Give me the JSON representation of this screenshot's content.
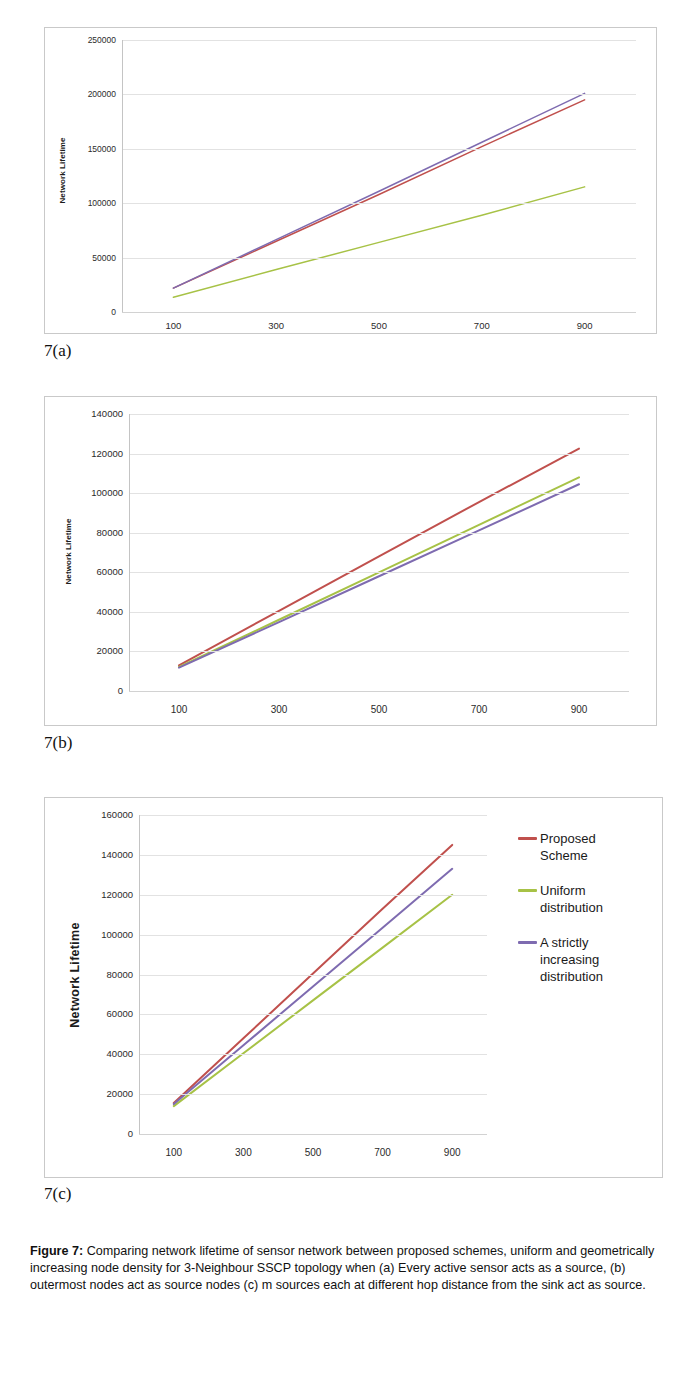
{
  "figure": {
    "caption_label": "Figure 7:",
    "caption_text": " Comparing network lifetime of sensor network between proposed schemes, uniform and geometrically increasing node density for 3-Neighbour SSCP topology when (a) Every active sensor acts as a source, (b) outermost nodes act as source nodes (c) m sources each at different hop distance from the sink act as source.",
    "sublabel_a": "7(a)",
    "sublabel_b": "7(b)",
    "sublabel_c": "7(c)"
  },
  "colors": {
    "proposed": "#C0504D",
    "uniform": "#A7C246",
    "strictly_increasing": "#7E6BB0",
    "grid": "#e2e2e2",
    "frame": "#c9c9c9"
  },
  "legend": {
    "items": [
      {
        "label": "Proposed\nScheme",
        "color": "#C0504D",
        "series": "Proposed Scheme"
      },
      {
        "label": "Uniform\ndistribution",
        "color": "#A7C246",
        "series": "Uniform distribution"
      },
      {
        "label": "A strictly\nincreasing\ndistribution",
        "color": "#7E6BB0",
        "series": "A strictly increasing distribution"
      }
    ]
  },
  "chart_data": [
    {
      "id": "chart_a",
      "type": "line",
      "title": "",
      "xlabel": "",
      "ylabel": "Network Lifetime",
      "x": [
        100,
        300,
        500,
        700,
        900
      ],
      "xticks": [
        "100",
        "300",
        "500",
        "700",
        "900"
      ],
      "yticks": [
        "0",
        "50000",
        "100000",
        "150000",
        "200000",
        "250000"
      ],
      "ytickvalues": [
        0,
        50000,
        100000,
        150000,
        200000,
        250000
      ],
      "ylim": [
        0,
        250000
      ],
      "xlim": [
        0,
        1000
      ],
      "grid": true,
      "legend_position": "none",
      "series": [
        {
          "name": "Proposed Scheme",
          "color": "#C0504D",
          "values": [
            22000,
            65000,
            108000,
            152000,
            195000
          ]
        },
        {
          "name": "Uniform distribution",
          "color": "#A7C246",
          "values": [
            13500,
            39000,
            64000,
            89000,
            115000
          ]
        },
        {
          "name": "A strictly increasing distribution",
          "color": "#7E6BB0",
          "values": [
            22000,
            66500,
            111000,
            156000,
            201000
          ]
        }
      ]
    },
    {
      "id": "chart_b",
      "type": "line",
      "title": "",
      "xlabel": "",
      "ylabel": "Network Lifetime",
      "x": [
        100,
        300,
        500,
        700,
        900
      ],
      "xticks": [
        "100",
        "300",
        "500",
        "700",
        "900"
      ],
      "yticks": [
        "0",
        "20000",
        "40000",
        "60000",
        "80000",
        "100000",
        "120000",
        "140000"
      ],
      "ytickvalues": [
        0,
        20000,
        40000,
        60000,
        80000,
        100000,
        120000,
        140000
      ],
      "ylim": [
        0,
        140000
      ],
      "xlim": [
        0,
        1000
      ],
      "grid": true,
      "legend_position": "none",
      "series": [
        {
          "name": "Proposed Scheme",
          "color": "#C0504D",
          "values": [
            13000,
            40500,
            68000,
            95500,
            122500
          ]
        },
        {
          "name": "Uniform distribution",
          "color": "#A7C246",
          "values": [
            12200,
            36000,
            60000,
            84000,
            108000
          ]
        },
        {
          "name": "A strictly increasing distribution",
          "color": "#7E6BB0",
          "values": [
            11800,
            34800,
            58000,
            81200,
            104500
          ]
        }
      ]
    },
    {
      "id": "chart_c",
      "type": "line",
      "title": "",
      "xlabel": "",
      "ylabel": "Network Lifetime",
      "x": [
        100,
        300,
        500,
        700,
        900
      ],
      "xticks": [
        "100",
        "300",
        "500",
        "700",
        "900"
      ],
      "yticks": [
        "0",
        "20000",
        "40000",
        "60000",
        "80000",
        "100000",
        "120000",
        "140000",
        "160000"
      ],
      "ytickvalues": [
        0,
        20000,
        40000,
        60000,
        80000,
        100000,
        120000,
        140000,
        160000
      ],
      "ylim": [
        0,
        160000
      ],
      "xlim": [
        0,
        1000
      ],
      "grid": true,
      "legend_position": "right",
      "series": [
        {
          "name": "Proposed Scheme",
          "color": "#C0504D",
          "values": [
            15500,
            48000,
            80500,
            113000,
            145000
          ]
        },
        {
          "name": "Uniform distribution",
          "color": "#A7C246",
          "values": [
            14000,
            40500,
            67000,
            93500,
            120000
          ]
        },
        {
          "name": "A strictly increasing distribution",
          "color": "#7E6BB0",
          "values": [
            15000,
            44500,
            74000,
            103500,
            133000
          ]
        }
      ]
    }
  ]
}
